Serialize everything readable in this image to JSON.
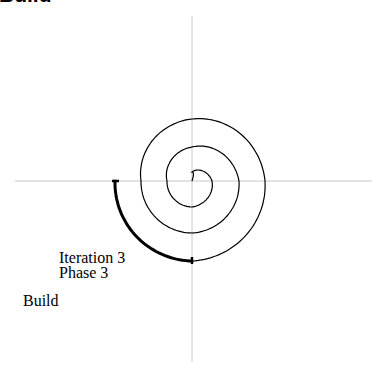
{
  "title": "Build",
  "diagram": {
    "axes": {
      "center": [
        192,
        181
      ],
      "x_range": [
        15,
        372
      ],
      "y_range": [
        16,
        362
      ],
      "color": "#c8c8c8"
    },
    "spiral": {
      "quarter_radii": [
        9,
        20,
        26,
        25,
        34,
        47,
        52,
        51,
        62,
        73,
        80,
        77
      ],
      "start_angle_deg": 270,
      "color": "#000000",
      "highlight_segment": {
        "from_quarter": 10,
        "to_quarter": 11,
        "stroke_width": 3
      }
    },
    "labels": {
      "iteration": "Iteration 3",
      "phase": "Phase 3",
      "stage": "Build"
    }
  }
}
